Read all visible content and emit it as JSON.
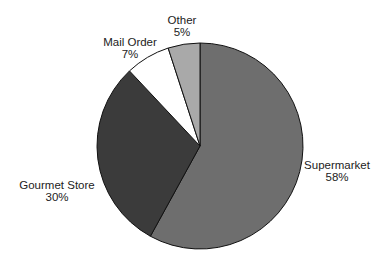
{
  "chart_data": {
    "type": "pie",
    "title": "",
    "start_angle_deg": 0,
    "direction": "clockwise",
    "slices": [
      {
        "label": "Supermarket",
        "value": 58,
        "value_label": "58%",
        "color": "#6e6e6e"
      },
      {
        "label": "Gourmet Store",
        "value": 30,
        "value_label": "30%",
        "color": "#3b3b3b"
      },
      {
        "label": "Mail Order",
        "value": 7,
        "value_label": "7%",
        "color": "#ffffff"
      },
      {
        "label": "Other",
        "value": 5,
        "value_label": "5%",
        "color": "#a9a9a9"
      }
    ],
    "legend": "none (direct labels)",
    "layout": {
      "cx": 200,
      "cy": 146,
      "r": 103
    }
  },
  "labels": [
    {
      "name": "Supermarket",
      "pct": "58%",
      "x": 337,
      "y1": 169,
      "y2": 181
    },
    {
      "name": "Gourmet Store",
      "pct": "30%",
      "x": 57,
      "y1": 189,
      "y2": 201
    },
    {
      "name": "Mail Order",
      "pct": "7%",
      "x": 130,
      "y1": 46,
      "y2": 58
    },
    {
      "name": "Other",
      "pct": "5%",
      "x": 182,
      "y1": 24,
      "y2": 36
    }
  ]
}
